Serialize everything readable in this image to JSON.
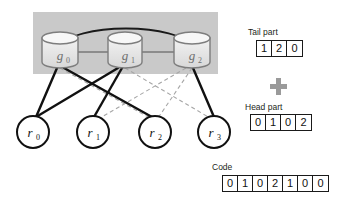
{
  "diagram": {
    "band": {
      "fill": "#c9c9c9",
      "x": 33,
      "y": 12,
      "w": 185,
      "h": 62
    },
    "group_nodes": [
      {
        "id": "g0",
        "label": "g₀",
        "cx": 60,
        "cy": 56
      },
      {
        "id": "g1",
        "label": "g₁",
        "cx": 125,
        "cy": 56
      },
      {
        "id": "g2",
        "label": "g₂",
        "cx": 192,
        "cy": 56
      }
    ],
    "record_nodes": [
      {
        "id": "r0",
        "label": "r₀",
        "cx": 33,
        "cy": 130
      },
      {
        "id": "r1",
        "label": "r₁",
        "cx": 92,
        "cy": 130
      },
      {
        "id": "r2",
        "label": "r₂",
        "cx": 155,
        "cy": 130
      },
      {
        "id": "r3",
        "label": "r₃",
        "cx": 214,
        "cy": 130
      }
    ],
    "group_edges": [
      {
        "from": "g0",
        "to": "g1",
        "style": "solid-gray"
      },
      {
        "from": "g1",
        "to": "g2",
        "style": "solid-gray"
      },
      {
        "from": "g0",
        "to": "g2",
        "style": "solid-black-arc"
      }
    ],
    "solid_edges": [
      {
        "from": "g0",
        "to": "r0",
        "style": "solid-black"
      },
      {
        "from": "g0",
        "to": "r1",
        "style": "solid-black"
      },
      {
        "from": "g1",
        "to": "r1",
        "style": "solid-black"
      },
      {
        "from": "g1",
        "to": "r2",
        "style": "solid-black"
      },
      {
        "from": "g2",
        "to": "r3",
        "style": "solid-black"
      }
    ],
    "dashed_edges": [
      {
        "from": "g0",
        "to": "r2",
        "style": "dashed-gray"
      },
      {
        "from": "g1",
        "to": "r3",
        "style": "dashed-gray"
      },
      {
        "from": "g2",
        "to": "r2",
        "style": "dashed-gray"
      },
      {
        "from": "g2",
        "to": "r1",
        "style": "dashed-gray"
      }
    ],
    "colors": {
      "band_fill": "#c9c9c9",
      "cylinder_fill": "#e8e8e8",
      "cylinder_stroke": "#808080",
      "node_stroke": "#111111",
      "solid_edge": "#111111",
      "dashed_edge": "#a6a6a6",
      "plus_fill": "#9a9a9a",
      "text": "#231f20"
    }
  },
  "arrays": {
    "tail": {
      "label": "Tail part",
      "cells": [
        "1",
        "2",
        "0"
      ]
    },
    "head": {
      "label": "Head part",
      "cells": [
        "0",
        "1",
        "0",
        "2"
      ]
    },
    "code": {
      "label": "Code",
      "cells": [
        "0",
        "1",
        "0",
        "2",
        "1",
        "0",
        "0"
      ]
    },
    "operator": {
      "icon": "plus-icon",
      "symbol": "+"
    }
  }
}
